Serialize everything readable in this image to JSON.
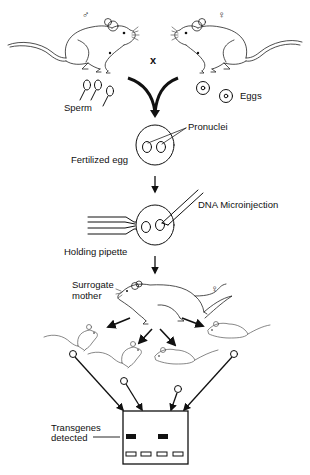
{
  "diagram": {
    "symbols": {
      "male": "♂",
      "female": "♀",
      "cross": "x",
      "surrogate_female": "♀"
    },
    "labels": {
      "sperm": "Sperm",
      "eggs": "Eggs",
      "pronuclei": "Pronuclei",
      "fertilized_egg": "Fertilized egg",
      "dna_microinjection": "DNA Microinjection",
      "holding_pipette": "Holding pipette",
      "surrogate_mother_line1": "Surrogate",
      "surrogate_mother_line2": "mother",
      "transgenes_line1": "Transgenes",
      "transgenes_line2": "detected"
    },
    "steps": [
      "Male and female mice crossed",
      "Sperm and eggs",
      "Fertilized egg with pronuclei",
      "DNA microinjection with holding pipette",
      "Implanted into surrogate mother",
      "Offspring (4)",
      "Gel analysis: transgenes detected"
    ],
    "gel": {
      "lanes": 4,
      "positive_lanes": [
        1,
        3
      ],
      "colors": {
        "band": "#111111",
        "well": "#ffffff",
        "border": "#111111"
      }
    },
    "colors": {
      "line": "#111111",
      "background": "#ffffff"
    }
  }
}
